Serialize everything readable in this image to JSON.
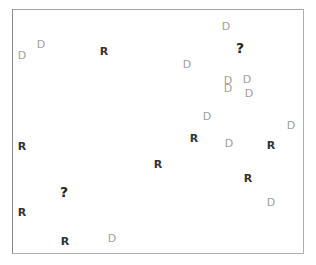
{
  "diagram": {
    "frame": {
      "left": 12,
      "top": 9,
      "right": 305,
      "bottom": 255,
      "border_color": "#b0b0b0"
    },
    "legend_colors": {
      "R": "#333333",
      "D": "#a0a0a0",
      "?": "#222222"
    },
    "labels": [
      {
        "text": "D",
        "kind": "D",
        "x": 22,
        "y": 55
      },
      {
        "text": "D",
        "kind": "D",
        "x": 41,
        "y": 44
      },
      {
        "text": "R",
        "kind": "R",
        "x": 104,
        "y": 51
      },
      {
        "text": "D",
        "kind": "D",
        "x": 226,
        "y": 26
      },
      {
        "text": "?",
        "kind": "Q",
        "x": 240,
        "y": 48
      },
      {
        "text": "D",
        "kind": "D",
        "x": 187,
        "y": 64
      },
      {
        "text": "D",
        "kind": "D",
        "x": 228,
        "y": 80
      },
      {
        "text": "D",
        "kind": "D",
        "x": 228,
        "y": 88
      },
      {
        "text": "D",
        "kind": "D",
        "x": 247,
        "y": 79
      },
      {
        "text": "D",
        "kind": "D",
        "x": 249,
        "y": 93
      },
      {
        "text": "D",
        "kind": "D",
        "x": 207,
        "y": 116
      },
      {
        "text": "D",
        "kind": "D",
        "x": 291,
        "y": 125
      },
      {
        "text": "R",
        "kind": "R",
        "x": 194,
        "y": 138
      },
      {
        "text": "D",
        "kind": "D",
        "x": 229,
        "y": 143
      },
      {
        "text": "R",
        "kind": "R",
        "x": 271,
        "y": 145
      },
      {
        "text": "R",
        "kind": "R",
        "x": 22,
        "y": 146
      },
      {
        "text": "R",
        "kind": "R",
        "x": 158,
        "y": 164
      },
      {
        "text": "R",
        "kind": "R",
        "x": 248,
        "y": 178
      },
      {
        "text": "?",
        "kind": "Q",
        "x": 64,
        "y": 192
      },
      {
        "text": "D",
        "kind": "D",
        "x": 271,
        "y": 202
      },
      {
        "text": "R",
        "kind": "R",
        "x": 22,
        "y": 212
      },
      {
        "text": "R",
        "kind": "R",
        "x": 65,
        "y": 241
      },
      {
        "text": "D",
        "kind": "D",
        "x": 112,
        "y": 238
      }
    ]
  }
}
